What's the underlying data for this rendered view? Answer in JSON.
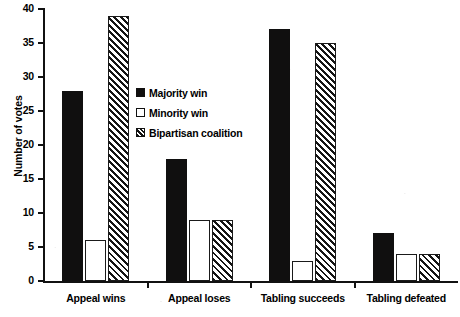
{
  "chart_data": {
    "type": "bar",
    "title": "",
    "xlabel": "",
    "ylabel": "Number of votes",
    "categories": [
      "Appeal wins",
      "Appeal loses",
      "Tabling succeeds",
      "Tabling defeated"
    ],
    "series": [
      {
        "name": "Majority win",
        "values": [
          28,
          18,
          37,
          7
        ],
        "style": "solid-black"
      },
      {
        "name": "Minority win",
        "values": [
          6,
          9,
          3,
          4
        ],
        "style": "open-white"
      },
      {
        "name": "Bipartisan coalition",
        "values": [
          39,
          9,
          35,
          4
        ],
        "style": "diagonal-hatch"
      }
    ],
    "ylim": [
      0,
      40
    ],
    "ytick_labels": [
      "0",
      "5",
      "10",
      "15",
      "20",
      "25",
      "30",
      "35",
      "40"
    ],
    "ytick_values": [
      0,
      5,
      10,
      15,
      20,
      25,
      30,
      35,
      40
    ],
    "grid": false,
    "legend_position": "upper-center-inside",
    "colors": {
      "axis": "#111111",
      "series_majority_win": "#100f0f",
      "series_minority_win": "#ffffff",
      "series_bipartisan_coalition": "#141414",
      "background": "#ffffff"
    }
  },
  "legend": {
    "entries": [
      {
        "label": "Majority win",
        "swatch": "solid-square-icon"
      },
      {
        "label": "Minority win",
        "swatch": "open-square-icon"
      },
      {
        "label": "Bipartisan coalition",
        "swatch": "hatched-square-icon"
      }
    ]
  }
}
